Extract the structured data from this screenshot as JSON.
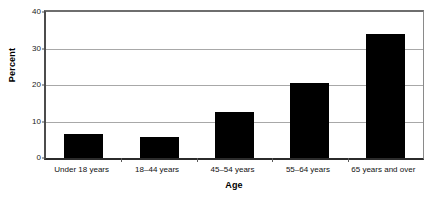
{
  "chart_data": {
    "type": "bar",
    "title": "",
    "xlabel": "Age",
    "ylabel": "Percent",
    "categories": [
      "Under 18 years",
      "18–44 years",
      "45–54 years",
      "55–64 years",
      "65 years and over"
    ],
    "values": [
      6.7,
      5.8,
      12.6,
      20.5,
      33.9
    ],
    "ylim": [
      0,
      40
    ],
    "yticks": [
      0,
      10,
      20,
      30,
      40
    ],
    "ytick_labels": [
      "0",
      "10",
      "20",
      "30",
      "40"
    ],
    "grid": true,
    "legend": false,
    "bar_color": "#000000",
    "background_color": "#ffffff",
    "gridline_color": "#a8a8a8",
    "axis_color": "#2b2b2b"
  },
  "axes": {
    "y_title": "Percent",
    "x_title": "Age"
  },
  "clipped_header_text": ""
}
